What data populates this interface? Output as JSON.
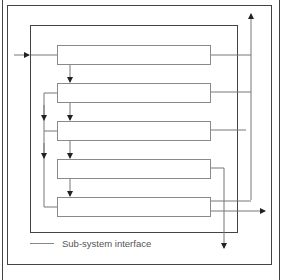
{
  "diagram": {
    "type": "nested-system-architecture",
    "frames": [
      {
        "name": "outer-system",
        "level": 1
      },
      {
        "name": "system-boundary",
        "level": 2
      },
      {
        "name": "subsystem-boundary",
        "level": 3
      }
    ],
    "modules": [
      {
        "id": "m1",
        "label": ""
      },
      {
        "id": "m2",
        "label": ""
      },
      {
        "id": "m3",
        "label": ""
      },
      {
        "id": "m4",
        "label": ""
      },
      {
        "id": "m5",
        "label": ""
      }
    ],
    "connections": [
      {
        "from": "external-input",
        "to": "m1"
      },
      {
        "from": "m1",
        "to": "m2"
      },
      {
        "from": "m2",
        "to": "m3"
      },
      {
        "from": "m2",
        "to": "m3",
        "via": "left-bus"
      },
      {
        "from": "m3",
        "to": "m4"
      },
      {
        "from": "m2",
        "to": "m5",
        "via": "left-bus"
      },
      {
        "from": "m4",
        "to": "m5"
      },
      {
        "from": "m1",
        "to": "external-output-top",
        "via": "right-bus"
      },
      {
        "from": "m2",
        "to": "external-output-top",
        "via": "right-bus"
      },
      {
        "from": "m3",
        "to": "external-output-top",
        "via": "right-bus"
      },
      {
        "from": "m5",
        "to": "external-output-top",
        "via": "right-bus"
      },
      {
        "from": "m4",
        "to": "external-output-bottom"
      },
      {
        "from": "m5",
        "to": "external-output-right"
      }
    ],
    "colors": {
      "frame": "#444444",
      "module_border": "#8a8a8a",
      "wire": "#777777",
      "arrow": "#222222"
    }
  },
  "legend": {
    "label": "Sub-system interface"
  }
}
